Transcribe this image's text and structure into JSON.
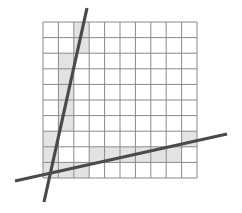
{
  "figure": {
    "grid": {
      "cols": 10,
      "rows": 10,
      "left": 43,
      "top": 22,
      "right": 197,
      "bottom": 178,
      "line_color": "#8a8a8a",
      "background": "#ffffff"
    },
    "shade_color": "#e3e3e3",
    "shaded_cells": [
      {
        "col": 2,
        "row": 0
      },
      {
        "col": 2,
        "row": 1
      },
      {
        "col": 1,
        "row": 2
      },
      {
        "col": 1,
        "row": 3
      },
      {
        "col": 1,
        "row": 4
      },
      {
        "col": 1,
        "row": 5
      },
      {
        "col": 1,
        "row": 6
      },
      {
        "col": 0,
        "row": 7
      },
      {
        "col": 0,
        "row": 8
      },
      {
        "col": 0,
        "row": 9
      },
      {
        "col": 1,
        "row": 9
      },
      {
        "col": 2,
        "row": 9
      },
      {
        "col": 3,
        "row": 8
      },
      {
        "col": 4,
        "row": 8
      },
      {
        "col": 5,
        "row": 8
      },
      {
        "col": 6,
        "row": 8
      },
      {
        "col": 7,
        "row": 8
      },
      {
        "col": 8,
        "row": 8
      },
      {
        "col": 9,
        "row": 7
      }
    ],
    "lines": [
      {
        "name": "steep-line",
        "x1": 87,
        "y1": 8,
        "x2": 44,
        "y2": 202,
        "color": "#4a4a4a",
        "width": 3.2
      },
      {
        "name": "shallow-line",
        "x1": 15,
        "y1": 181,
        "x2": 227,
        "y2": 134,
        "color": "#4a4a4a",
        "width": 3.2
      }
    ]
  }
}
